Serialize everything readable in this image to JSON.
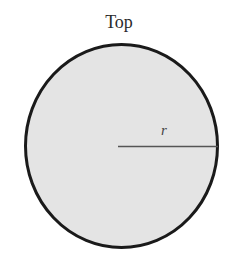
{
  "diagram": {
    "title": "Top",
    "radius_label": "r",
    "shape": "circle",
    "fill_color": "#e4e4e4",
    "stroke_color": "#1a1a1a",
    "line_color": "#555555"
  }
}
